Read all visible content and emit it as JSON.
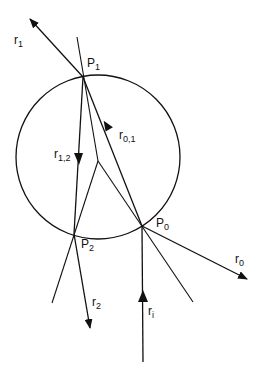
{
  "labels": {
    "r1": {
      "base": "r",
      "sub": "1"
    },
    "p1": {
      "base": "P",
      "sub": "1"
    },
    "r12": {
      "base": "r",
      "sub": "1,2"
    },
    "r01": {
      "base": "r",
      "sub": "0,1"
    },
    "p2": {
      "base": "P",
      "sub": "2"
    },
    "p0": {
      "base": "P",
      "sub": "0"
    },
    "r0": {
      "base": "r",
      "sub": "0"
    },
    "r2": {
      "base": "r",
      "sub": "2"
    },
    "ri": {
      "base": "r",
      "sub": "i"
    }
  }
}
